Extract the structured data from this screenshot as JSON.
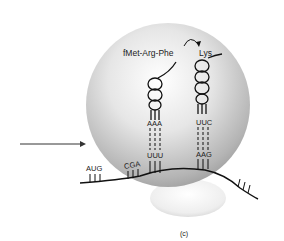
{
  "figure": {
    "panel_label": "(c)",
    "peptide_label": "fMet-Arg-Phe",
    "incoming_amino_acid": "Lys",
    "mrna_codons_left": [
      "A",
      "U",
      "G",
      "C",
      "G",
      "A"
    ],
    "trna_left": {
      "anticodon": [
        "A",
        "A",
        "A"
      ],
      "codon": [
        "U",
        "U",
        "U"
      ]
    },
    "trna_right": {
      "anticodon": [
        "U",
        "U",
        "C"
      ],
      "codon": [
        "A",
        "A",
        "G"
      ]
    },
    "arrow": "incoming-arrow"
  },
  "labels": {
    "aug": "AUG",
    "cga": "CGA",
    "aaa": "AAA",
    "uuu": "UUU",
    "uuc": "UUC",
    "aag": "AAG"
  }
}
